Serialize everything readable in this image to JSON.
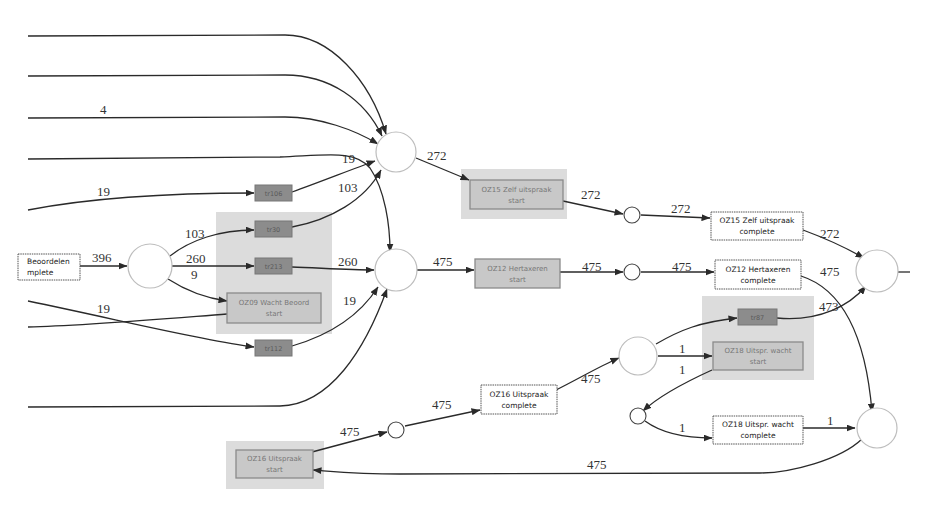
{
  "figure": {
    "type": "process-model-petri-net",
    "edge_labels": {
      "top_in_4": "4",
      "in_19_a": "19",
      "tau1_to_p1": "19",
      "tau2_to_p1": "103",
      "p1_to_oz15start": "272",
      "pL_out_103": "103",
      "pL_in_396": "396",
      "pL_out_260": "260",
      "pL_out_9": "9",
      "in_19_b": "19",
      "tau3_to_p2": "260",
      "tau4_to_p2": "19",
      "p2_to_oz12start": "475",
      "oz15start_to_ps1": "272",
      "ps1_to_oz15complete": "272",
      "oz15complete_to_pR1": "272",
      "oz12start_to_ps2": "475",
      "ps2_to_oz12complete": "475",
      "oz12complete_to_pR2": "475",
      "tau5_to_pR1": "473",
      "oz16complete_to_p3": "475",
      "p3_to_tau5": "473",
      "p3_to_oz18start": "1",
      "oz18start_to_ps4": "1",
      "ps4_to_oz18complete": "1",
      "oz18complete_to_pR2": "1",
      "oz16start_to_ps3": "475",
      "ps3_to_oz16complete": "475",
      "pR2_to_oz16start": "475"
    },
    "transitions": {
      "beoordelen_complete": {
        "line1": "Beoordelen",
        "line2": "mplete"
      },
      "oz15_start": {
        "line1": "OZ15 Zelf uitspraak",
        "line2": "start"
      },
      "oz15_complete": {
        "line1": "OZ15 Zelf uitspraak",
        "line2": "complete"
      },
      "oz12_start": {
        "line1": "OZ12 Hertaxeren",
        "line2": "start"
      },
      "oz12_complete": {
        "line1": "OZ12 Hertaxeren",
        "line2": "complete"
      },
      "oz09_start": {
        "line1": "OZ09 Wacht Beoord",
        "line2": "start"
      },
      "oz16_start": {
        "line1": "OZ16 Uitspraak",
        "line2": "start"
      },
      "oz16_complete": {
        "line1": "OZ16 Uitspraak",
        "line2": "complete"
      },
      "oz18_start": {
        "line1": "OZ18 Uitspr. wacht",
        "line2": "start"
      },
      "oz18_complete": {
        "line1": "OZ18 Uitspr. wacht",
        "line2": "complete"
      },
      "tau_106": "tr106",
      "tau_30": "tr30",
      "tau_213": "tr213",
      "tau_112": "tr112",
      "tau_87": "tr87"
    },
    "colors": {
      "edge": "#2a2a2a",
      "highlight": "#dcdcdc",
      "start_fill": "#c8c8c8",
      "tau_fill": "#8c8c8c",
      "place_stroke": "#bdbdbd"
    }
  }
}
